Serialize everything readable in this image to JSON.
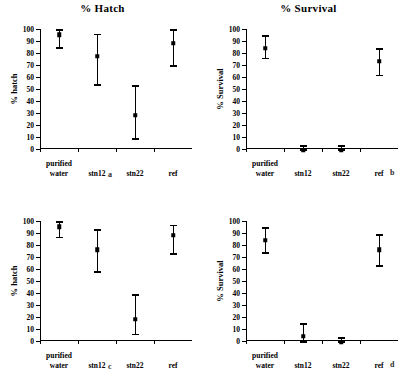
{
  "figure": {
    "panel_letters": {
      "a": "a",
      "b": "b",
      "c": "c",
      "d": "d"
    }
  },
  "chart_data": [
    {
      "type": "scatter",
      "panel": "a",
      "title": "% Hatch",
      "ylabel": "% hatch",
      "xlabel": "",
      "categories": [
        "purified water",
        "stn12",
        "stn22",
        "ref"
      ],
      "category_lines": [
        [
          "purified",
          "water"
        ],
        [
          "stn12"
        ],
        [
          "stn22"
        ],
        [
          "ref"
        ]
      ],
      "values": [
        97,
        79,
        30,
        90
      ],
      "err_low": [
        85,
        54,
        9,
        70
      ],
      "err_high": [
        100,
        96,
        53,
        100
      ],
      "ylim": [
        0,
        100
      ],
      "yticks": [
        0,
        10,
        20,
        30,
        40,
        50,
        60,
        70,
        80,
        90,
        100
      ],
      "grid": false,
      "legend": "none"
    },
    {
      "type": "scatter",
      "panel": "b",
      "title": "% Survival",
      "ylabel": "% Survival",
      "xlabel": "",
      "categories": [
        "purified water",
        "stn12",
        "stn22",
        "ref"
      ],
      "category_lines": [
        [
          "purified",
          "water"
        ],
        [
          "stn12"
        ],
        [
          "stn22"
        ],
        [
          "ref"
        ]
      ],
      "values": [
        86,
        1,
        1,
        75
      ],
      "err_low": [
        76,
        0,
        0,
        62
      ],
      "err_high": [
        95,
        3,
        3,
        84
      ],
      "ylim": [
        0,
        100
      ],
      "yticks": [
        0,
        10,
        20,
        30,
        40,
        50,
        60,
        70,
        80,
        90,
        100
      ],
      "grid": false,
      "legend": "none"
    },
    {
      "type": "scatter",
      "panel": "c",
      "title": "",
      "ylabel": "% hatch",
      "xlabel": "",
      "categories": [
        "purified water",
        "stn12",
        "stn22",
        "ref"
      ],
      "category_lines": [
        [
          "purified",
          "water"
        ],
        [
          "stn12"
        ],
        [
          "stn22"
        ],
        [
          "ref"
        ]
      ],
      "values": [
        97,
        78,
        20,
        90
      ],
      "err_low": [
        87,
        58,
        6,
        73
      ],
      "err_high": [
        100,
        93,
        39,
        97
      ],
      "ylim": [
        0,
        100
      ],
      "yticks": [
        0,
        10,
        20,
        30,
        40,
        50,
        60,
        70,
        80,
        90,
        100
      ],
      "grid": false,
      "legend": "none"
    },
    {
      "type": "scatter",
      "panel": "d",
      "title": "",
      "ylabel": "% Survival",
      "xlabel": "",
      "categories": [
        "purified water",
        "stn12",
        "stn22",
        "ref"
      ],
      "category_lines": [
        [
          "purified",
          "water"
        ],
        [
          "stn12"
        ],
        [
          "stn22"
        ],
        [
          "ref"
        ]
      ],
      "values": [
        86,
        6,
        1,
        78
      ],
      "err_low": [
        74,
        0,
        0,
        63
      ],
      "err_high": [
        95,
        15,
        3,
        89
      ],
      "ylim": [
        0,
        100
      ],
      "yticks": [
        0,
        10,
        20,
        30,
        40,
        50,
        60,
        70,
        80,
        90,
        100
      ],
      "grid": false,
      "legend": "none"
    }
  ]
}
